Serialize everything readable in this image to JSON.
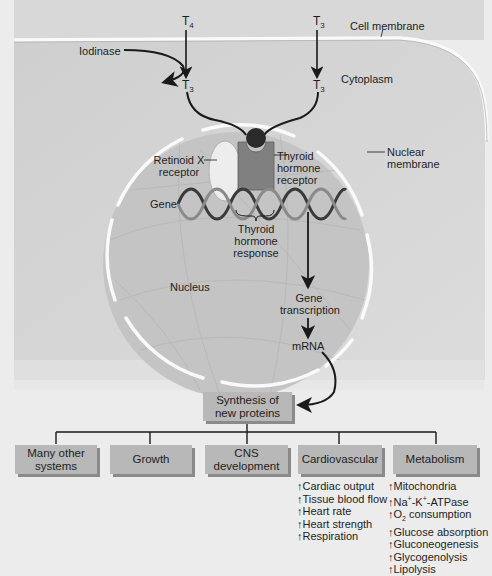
{
  "diagram": {
    "hormones": {
      "t4_top": {
        "base": "T",
        "sub": "4"
      },
      "t3_top": {
        "base": "T",
        "sub": "3"
      },
      "t3_left": {
        "base": "T",
        "sub": "3"
      },
      "t3_right": {
        "base": "T",
        "sub": "3"
      }
    },
    "labels": {
      "cell_membrane": "Cell membrane",
      "iodinase": "Iodinase",
      "cytoplasm": "Cytoplasm",
      "nuclear_membrane_1": "Nuclear",
      "nuclear_membrane_2": "membrane",
      "retinoid_1": "Retinoid X",
      "retinoid_2": "receptor",
      "thyroid_receptor_1": "Thyroid",
      "thyroid_receptor_2": "hormone",
      "thyroid_receptor_3": "receptor",
      "gene": "Gene",
      "response_1": "Thyroid",
      "response_2": "hormone",
      "response_3": "response",
      "nucleus": "Nucleus",
      "gene_transcription_1": "Gene",
      "gene_transcription_2": "transcription",
      "mrna": "mRNA"
    },
    "synthesis_box": {
      "line1": "Synthesis of",
      "line2": "new proteins"
    },
    "effect_boxes": [
      {
        "line1": "Many other",
        "line2": "systems"
      },
      {
        "line1": "Growth",
        "line2": ""
      },
      {
        "line1": "CNS",
        "line2": "development"
      },
      {
        "line1": "Cardiovascular",
        "line2": ""
      },
      {
        "line1": "Metabolism",
        "line2": ""
      }
    ],
    "cardiovascular_effects": [
      "↑Cardiac output",
      "↑Tissue blood flow",
      "↑Heart rate",
      "↑Heart strength",
      "↑Respiration"
    ],
    "metabolism_effects": {
      "mitochondria": "↑Mitochondria",
      "atpase_prefix": "↑Na",
      "atpase_sup1": "+",
      "atpase_mid": "-K",
      "atpase_sup2": "+",
      "atpase_suffix": "-ATPase",
      "o2_prefix": "↑O",
      "o2_sub": "2",
      "o2_suffix": " consumption",
      "glucose_absorption": "↑Glucose absorption",
      "gluconeogenesis": "↑Gluconeogenesis",
      "glycogenolysis": "↑Glycogenolysis",
      "lipolysis": "↑Lipolysis"
    },
    "colors": {
      "background": "#ececec",
      "cytoplasm": "#d4d4d4",
      "nucleus": "#c4c4c4",
      "membrane": "#fafafa",
      "receptor": "#808080",
      "retinoid": "#ededed",
      "ligand": "#2a2a2a",
      "box": "#b8b8b8"
    }
  }
}
